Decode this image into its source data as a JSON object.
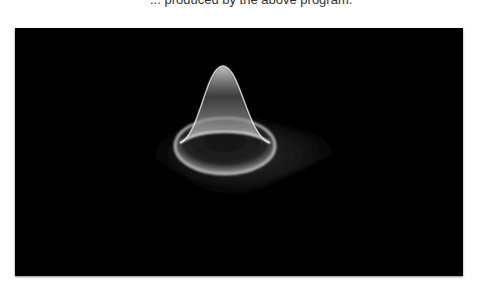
{
  "caption": {
    "text": "... produced by the above program."
  },
  "figure": {
    "background_color": "#000000",
    "surface_color": "#ffffff"
  }
}
